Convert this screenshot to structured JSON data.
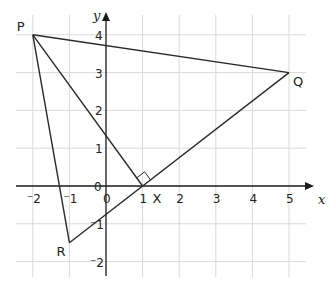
{
  "diagram": {
    "type": "coordinate-geometry",
    "axes": {
      "x_label": "x",
      "y_label": "y",
      "x_range": [
        -2,
        5
      ],
      "y_range": [
        -2,
        4
      ],
      "x_ticks": [
        "⁻2",
        "⁻1",
        "0",
        "1",
        "2",
        "3",
        "4",
        "5"
      ],
      "x_tick_values": [
        -2,
        -1,
        0,
        1,
        2,
        3,
        4,
        5
      ],
      "y_ticks": [
        "⁻2",
        "⁻1",
        "0",
        "1",
        "2",
        "3",
        "4"
      ],
      "y_tick_values": [
        -2,
        -1,
        0,
        1,
        2,
        3,
        4
      ],
      "grid": true
    },
    "points": [
      {
        "label": "P",
        "x": -2,
        "y": 4
      },
      {
        "label": "Q",
        "x": 5,
        "y": 3
      },
      {
        "label": "R",
        "x": -1,
        "y": -1.5
      },
      {
        "label": "X",
        "x": 1,
        "y": 0
      }
    ],
    "segments": [
      [
        "P",
        "Q"
      ],
      [
        "Q",
        "R"
      ],
      [
        "R",
        "P"
      ],
      [
        "P",
        "X"
      ]
    ],
    "right_angle_at": "X",
    "colors": {
      "grid": "#d9d9d9",
      "line": "#2a2a2a",
      "axis": "#1a1a1a"
    }
  }
}
